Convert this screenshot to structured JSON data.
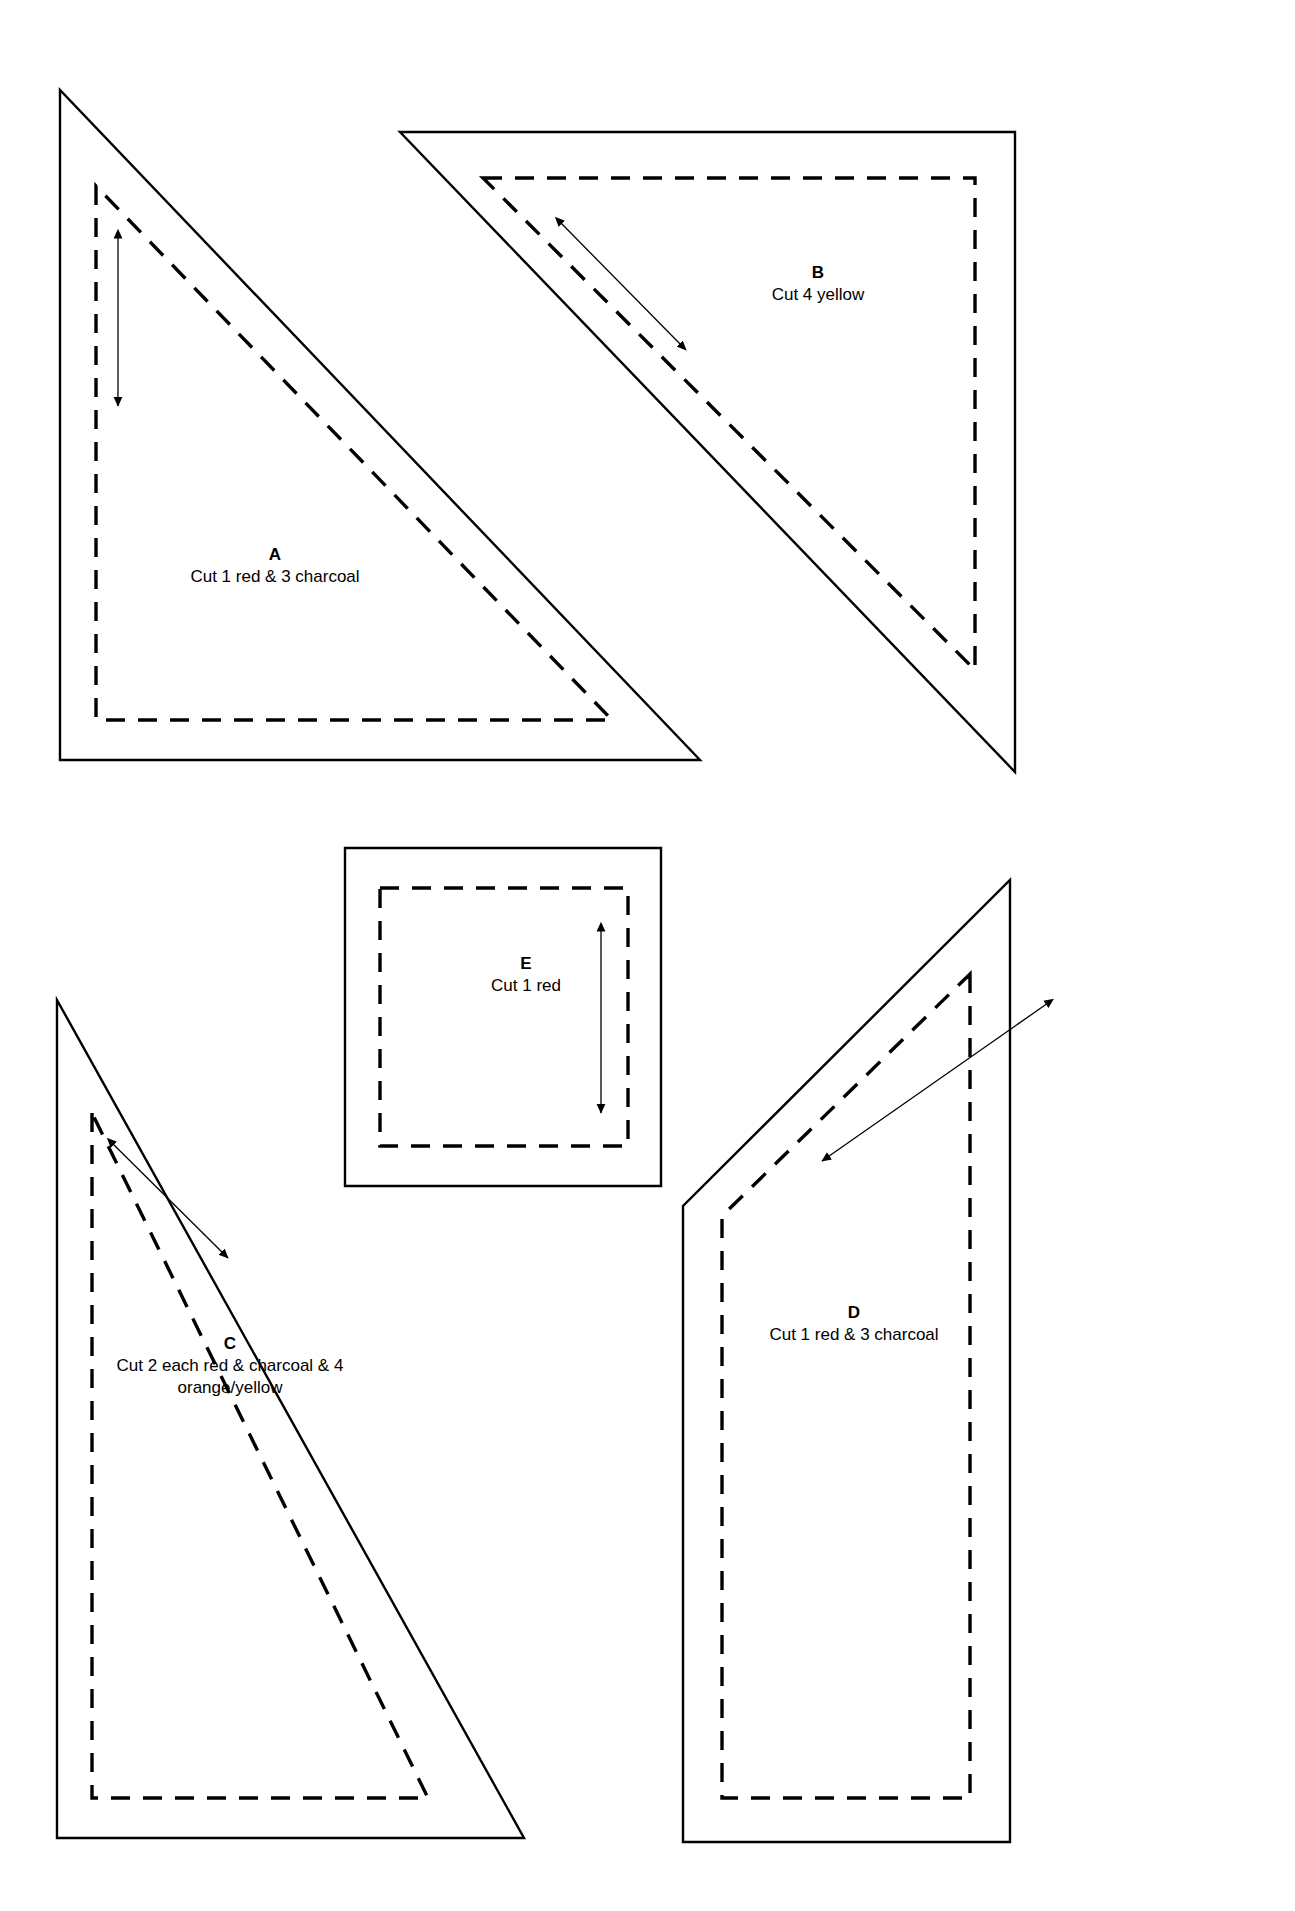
{
  "sheet": {
    "width": 1295,
    "height": 1911,
    "background_color": "#ffffff",
    "line_color": "#000000",
    "kind": "quilt-pattern-template-sheet"
  },
  "legend": {
    "cut_line_style": "solid",
    "seam_line_style": "dashed",
    "grain_line_style": "double-headed arrow"
  },
  "pieces": [
    {
      "id": "A",
      "letter": "A",
      "description": "Cut 1 red & 3 charcoal",
      "shape": "right-triangle",
      "label_x": 175,
      "label_y": 544,
      "label_width": 200,
      "cut_path": "M 60,90 L 60,760 L 700,760 Z",
      "seam_path": "M 96,186 L 96,720 L 612,720 Z",
      "grain": {
        "x1": 118,
        "y1": 236,
        "x2": 118,
        "y2": 406,
        "both_ends": true
      }
    },
    {
      "id": "B",
      "letter": "B",
      "description": "Cut 4 yellow",
      "shape": "right-triangle",
      "label_x": 718,
      "label_y": 262,
      "label_width": 200,
      "cut_path": "M 400,132 L 1015,132 L 1015,772 Z",
      "seam_path": "M 483,178 L 975,178 L 975,670 Z",
      "grain": {
        "x1": 560,
        "y1": 222,
        "x2": 686,
        "y2": 350,
        "both_ends": true
      }
    },
    {
      "id": "C",
      "letter": "C",
      "description_line1": "Cut 2 each red & charcoal & 4",
      "description_line2": "orange/yellow",
      "shape": "right-triangle",
      "label_x": 80,
      "label_y": 1333,
      "label_width": 300,
      "cut_path": "M 57,1000 L 57,1838 L 524,1838 Z",
      "seam_path": "M 92,1113 L 92,1798 L 428,1798 Z",
      "grain": {
        "x1": 112,
        "y1": 1143,
        "x2": 228,
        "y2": 1258,
        "both_ends": true
      }
    },
    {
      "id": "D",
      "letter": "D",
      "description": "Cut 1 red & 3 charcoal",
      "shape": "pentagon",
      "label_x": 754,
      "label_y": 1302,
      "label_width": 200,
      "cut_path": "M 1010,880 L 1010,1842 L 683,1842 L 683,1206 Z",
      "seam_path": "M 970,974 L 970,1798 L 722,1798 L 722,1216 Z",
      "grain": {
        "x1": 1048,
        "y1": 1003,
        "x2": 822,
        "y2": 1161,
        "both_ends": true
      }
    },
    {
      "id": "E",
      "letter": "E",
      "description": "Cut 1 red",
      "shape": "square",
      "label_x": 426,
      "label_y": 953,
      "label_width": 200,
      "cut_path": "M 345,848 L 661,848 L 661,1186 L 345,1186 Z",
      "seam_path": "M 380,888 L 628,888 L 628,1146 L 380,1146 Z",
      "grain": {
        "x1": 601,
        "y1": 929,
        "x2": 601,
        "y2": 1113,
        "both_ends": true
      }
    }
  ]
}
